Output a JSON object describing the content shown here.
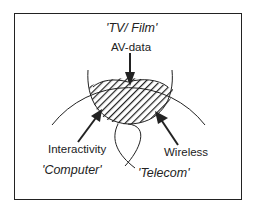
{
  "diagram": {
    "title_domain": "'TV/ Film'",
    "labels": {
      "av_data": "AV-data",
      "interactivity": "Interactivity",
      "wireless": "Wireless",
      "computer": "'Computer'",
      "telecom": "'Telecom'"
    },
    "colors": {
      "line": "#222222",
      "background": "#ffffff"
    }
  }
}
